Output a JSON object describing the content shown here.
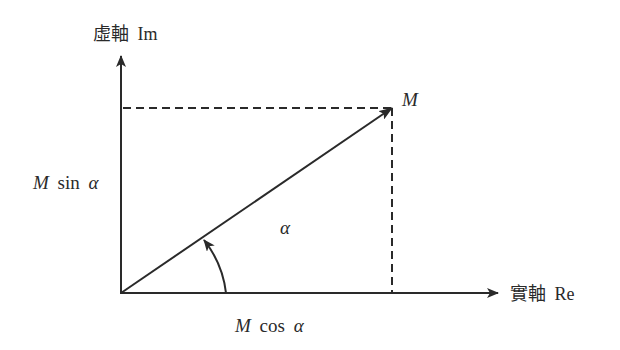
{
  "diagram": {
    "type": "phasor-diagram",
    "colors": {
      "stroke": "#2a2a2a",
      "background": "#ffffff"
    },
    "axes": {
      "imaginary": {
        "label_cjk": "虛軸",
        "label_latin": "Im"
      },
      "real": {
        "label_cjk": "實軸",
        "label_latin": "Re"
      }
    },
    "vector": {
      "label": "M"
    },
    "angle": {
      "label": "α"
    },
    "projections": {
      "vertical": {
        "label_symbol": "M",
        "label_rest": "sin",
        "label_angle": "α"
      },
      "horizontal": {
        "label_symbol": "M",
        "label_rest": "cos",
        "label_angle": "α"
      }
    }
  }
}
